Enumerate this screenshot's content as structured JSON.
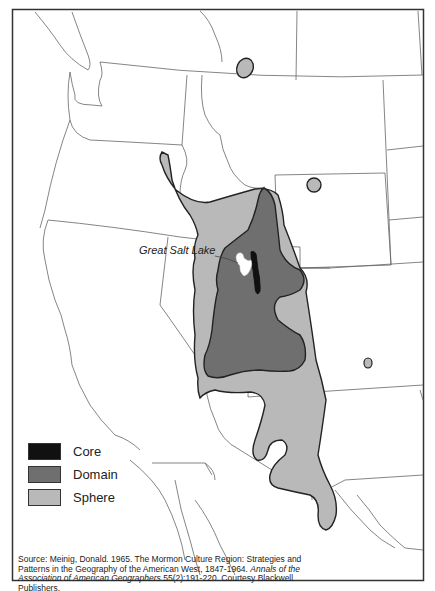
{
  "map": {
    "title": "Mormon Culture Region",
    "label_lake": "Great Salt Lake",
    "colors": {
      "core": "#111111",
      "domain": "#6f6f6f",
      "sphere": "#b9b9b9",
      "lake": "#ffffff",
      "border": "#333333",
      "state_lines": "#555555"
    }
  },
  "legend": {
    "items": [
      {
        "label": "Core",
        "color": "#111111"
      },
      {
        "label": "Domain",
        "color": "#6f6f6f"
      },
      {
        "label": "Sphere",
        "color": "#b9b9b9"
      }
    ]
  },
  "source": {
    "text1": "Source: Meinig, Donald. 1965. The Mormon Culture Region: Strategies and Patterns in the Geography of the American West, 1847-1964. ",
    "journal": "Annals of the Association of American Geographers",
    "text2": " 55(2):191-220. Courtesy Blackwell Publishers."
  }
}
